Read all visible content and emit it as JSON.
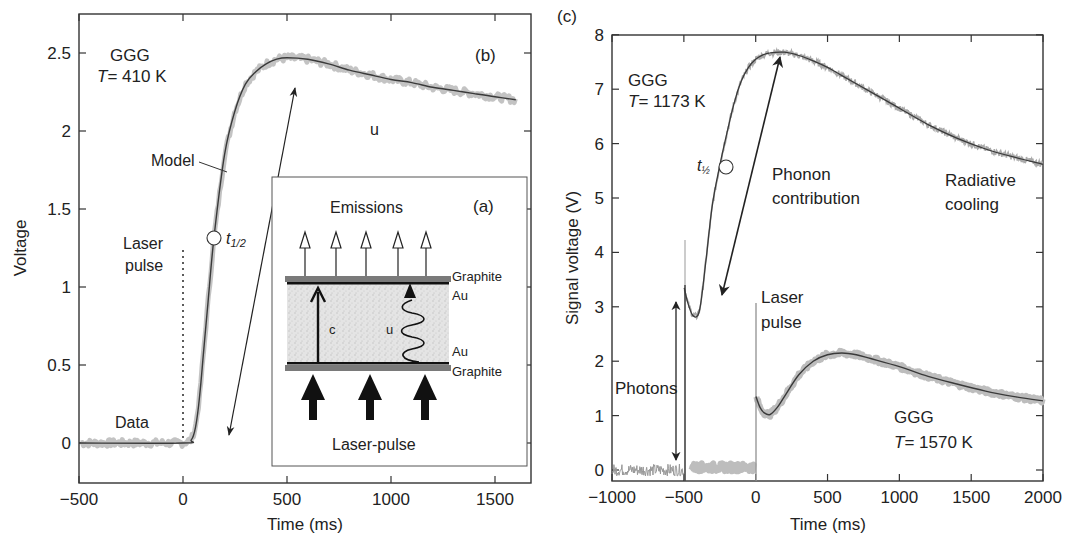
{
  "chart_data": [
    {
      "panel": "(b)",
      "type": "line",
      "title": "",
      "xlabel": "Time (ms)",
      "ylabel": "Voltage",
      "xlim": [
        -500,
        1700
      ],
      "ylim": [
        -0.25,
        2.75
      ],
      "xticks": [
        -500,
        0,
        500,
        1000,
        1500
      ],
      "xtick_labels": [
        "−500",
        "0",
        "500",
        "1000",
        "1500"
      ],
      "yticks": [
        0,
        0.5,
        1,
        1.5,
        2,
        2.5
      ],
      "ytick_labels": [
        "0",
        "0.5",
        "1",
        "1.5",
        "2",
        "2.5"
      ],
      "grid": false,
      "series": [
        {
          "name": "Model",
          "x": [
            -500,
            0,
            40,
            60,
            80,
            100,
            120,
            150,
            200,
            250,
            300,
            350,
            400,
            450,
            500,
            600,
            700,
            800,
            900,
            1000,
            1100,
            1200,
            1300,
            1400,
            1500,
            1600
          ],
          "y": [
            0,
            0,
            0.02,
            0.1,
            0.3,
            0.6,
            0.9,
            1.33,
            1.85,
            2.13,
            2.3,
            2.38,
            2.43,
            2.46,
            2.47,
            2.46,
            2.43,
            2.39,
            2.36,
            2.33,
            2.31,
            2.28,
            2.26,
            2.24,
            2.22,
            2.2
          ]
        },
        {
          "name": "Data",
          "style": "noisy gray band following model",
          "x": [
            -500,
            -250,
            0,
            500,
            1000,
            1600
          ],
          "y": [
            0,
            0,
            0,
            2.47,
            2.33,
            2.2
          ]
        }
      ],
      "annotations": {
        "sample": "GGG",
        "temperature": "T = 410 K",
        "panel_label": "(b)",
        "model_label": "Model",
        "data_label": "Data",
        "laser_pulse_label": [
          "Laser",
          "pulse"
        ],
        "half_time_label": "t1/2",
        "half_time_point": {
          "x": 150,
          "y": 1.33
        },
        "arrow_label": "u"
      },
      "inset": {
        "panel_label": "(a)",
        "top_text": "Emissions",
        "bottom_text": "Laser-pulse",
        "layers": [
          "Graphite",
          "Au",
          "Au",
          "Graphite"
        ],
        "arrow_labels": [
          "c",
          "u"
        ]
      }
    },
    {
      "panel": "(c)",
      "type": "line",
      "title": "",
      "xlabel": "Time (ms)",
      "ylabel": "Signal voltage (V)",
      "xlim": [
        -1000,
        2000
      ],
      "ylim": [
        -0.2,
        8
      ],
      "xticks": [
        -1000,
        -500,
        0,
        500,
        1000,
        1500,
        2000
      ],
      "xtick_labels": [
        "−1000",
        "−500",
        "0",
        "500",
        "1000",
        "1500",
        "2000"
      ],
      "yticks": [
        0,
        1,
        2,
        3,
        4,
        5,
        6,
        7,
        8
      ],
      "ytick_labels": [
        "0",
        "1",
        "2",
        "3",
        "4",
        "5",
        "6",
        "7",
        "8"
      ],
      "grid": false,
      "series": [
        {
          "name": "GGG T = 1173 K",
          "x": [
            -1000,
            -500,
            -498,
            -470,
            -440,
            -410,
            -390,
            -370,
            -340,
            -300,
            -250,
            -200,
            -150,
            -100,
            -50,
            0,
            50,
            100,
            200,
            300,
            400,
            500,
            600,
            800,
            1000,
            1200,
            1400,
            1600,
            1800,
            2000
          ],
          "y": [
            0,
            0,
            3.35,
            3.05,
            2.85,
            2.82,
            2.95,
            3.3,
            4.0,
            4.9,
            5.6,
            6.2,
            6.75,
            7.15,
            7.4,
            7.55,
            7.63,
            7.67,
            7.68,
            7.62,
            7.52,
            7.4,
            7.25,
            6.95,
            6.65,
            6.35,
            6.1,
            5.9,
            5.75,
            5.62
          ]
        },
        {
          "name": "GGG T = 1570 K",
          "x": [
            -450,
            0,
            2,
            30,
            60,
            100,
            150,
            200,
            300,
            400,
            500,
            600,
            700,
            800,
            1000,
            1200,
            1400,
            1600,
            1800,
            2000
          ],
          "y": [
            0,
            0,
            1.35,
            1.15,
            1.05,
            1.02,
            1.15,
            1.35,
            1.75,
            2.0,
            2.12,
            2.15,
            2.12,
            2.05,
            1.9,
            1.72,
            1.58,
            1.45,
            1.35,
            1.27
          ]
        }
      ],
      "annotations": {
        "panel_label": "(c)",
        "sample_1": "GGG",
        "temperature_1": "T = 1173 K",
        "sample_2": "GGG",
        "temperature_2": "T = 1570 K",
        "half_time_label": "t½",
        "half_time_point": {
          "x": -250,
          "y": 5.6
        },
        "phonon_label": [
          "Phonon",
          "contribution"
        ],
        "radiative_label": [
          "Radiative",
          "cooling"
        ],
        "laser_pulse_label": [
          "Laser",
          "pulse"
        ],
        "photons_label": "Photons"
      }
    }
  ],
  "labels": {
    "b_panel": "(b)",
    "a_panel": "(a)",
    "c_panel": "(c)",
    "b_ggg": "GGG",
    "b_T": "T",
    "b_temp": "= 410 K",
    "b_model": "Model",
    "b_data": "Data",
    "b_laser1": "Laser",
    "b_laser2": "pulse",
    "b_thalf_t": "t",
    "b_thalf_sub": "1/2",
    "b_u": "u",
    "b_ylabel": "Voltage",
    "b_xlabel": "Time (ms)",
    "a_emissions": "Emissions",
    "a_laser": "Laser-pulse",
    "a_graphite_top": "Graphite",
    "a_au_top": "Au",
    "a_au_bottom": "Au",
    "a_graphite_bottom": "Graphite",
    "a_c": "c",
    "a_u": "u",
    "c_ggg1": "GGG",
    "c_T1": "T",
    "c_temp1": "= 1173 K",
    "c_ggg2": "GGG",
    "c_T2": "T",
    "c_temp2": "= 1570 K",
    "c_thalf_t": "t",
    "c_thalf_sub": "½",
    "c_phonon1": "Phonon",
    "c_phonon2": "contribution",
    "c_rad1": "Radiative",
    "c_rad2": "cooling",
    "c_laser1": "Laser",
    "c_laser2": "pulse",
    "c_photons": "Photons",
    "c_ylabel": "Signal voltage (V)",
    "c_xlabel": "Time (ms)"
  },
  "colors": {
    "model_line": "#3a3a3a",
    "data_band": "#bdbdbd",
    "axis": "#333333",
    "graphite": "#7a7a7a",
    "sample_fill": "#e2e2e2"
  }
}
